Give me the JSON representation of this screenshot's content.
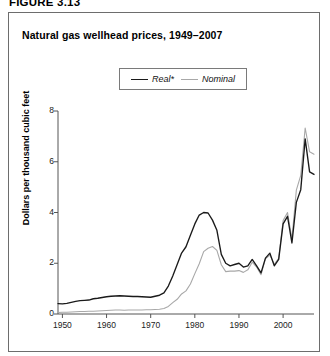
{
  "figure": {
    "label": "FIGURE 3.13",
    "title": "Natural gas wellhead prices, 1949–2007",
    "footnote": "*In chained (2000) dollars, calculated by using gross domestic product implicit"
  },
  "legend": {
    "items": [
      {
        "label": "Real*",
        "color": "#1a1a1a",
        "style": "thick"
      },
      {
        "label": "Nominal",
        "color": "#a8a8a8",
        "style": "thin"
      }
    ]
  },
  "axes": {
    "y_label": "Dollars per thousand cubic feet",
    "y_ticks": [
      "0",
      "2",
      "4",
      "6",
      "8"
    ],
    "x_ticks": [
      "1950",
      "1960",
      "1970",
      "1980",
      "1990",
      "2000"
    ]
  },
  "chart_data": {
    "type": "line",
    "title": "Natural gas wellhead prices, 1949–2007",
    "xlabel": "",
    "ylabel": "Dollars per thousand cubic feet",
    "xlim": [
      1949,
      2007
    ],
    "ylim": [
      0,
      8
    ],
    "yticks": [
      0,
      2,
      4,
      6,
      8
    ],
    "xticks": [
      1950,
      1960,
      1970,
      1980,
      1990,
      2000
    ],
    "grid": false,
    "legend_position": "top-center",
    "annotations": [
      "*In chained (2000) dollars, calculated by using gross domestic product implicit"
    ],
    "x": [
      1949,
      1950,
      1951,
      1952,
      1953,
      1954,
      1955,
      1956,
      1957,
      1958,
      1959,
      1960,
      1961,
      1962,
      1963,
      1964,
      1965,
      1966,
      1967,
      1968,
      1969,
      1970,
      1971,
      1972,
      1973,
      1974,
      1975,
      1976,
      1977,
      1978,
      1979,
      1980,
      1981,
      1982,
      1983,
      1984,
      1985,
      1986,
      1987,
      1988,
      1989,
      1990,
      1991,
      1992,
      1993,
      1994,
      1995,
      1996,
      1997,
      1998,
      1999,
      2000,
      2001,
      2002,
      2003,
      2004,
      2005,
      2006,
      2007
    ],
    "series": [
      {
        "name": "Real*",
        "color": "#1a1a1a",
        "values": [
          0.41,
          0.4,
          0.42,
          0.46,
          0.5,
          0.53,
          0.54,
          0.55,
          0.6,
          0.62,
          0.65,
          0.68,
          0.7,
          0.71,
          0.72,
          0.71,
          0.7,
          0.69,
          0.69,
          0.68,
          0.67,
          0.66,
          0.7,
          0.74,
          0.83,
          1.1,
          1.5,
          1.95,
          2.4,
          2.65,
          3.1,
          3.55,
          3.9,
          4.0,
          3.98,
          3.7,
          3.3,
          2.35,
          2.0,
          1.9,
          1.95,
          2.0,
          1.85,
          1.9,
          2.15,
          1.9,
          1.62,
          2.2,
          2.4,
          1.9,
          2.15,
          3.55,
          3.85,
          2.8,
          4.4,
          4.9,
          6.9,
          5.6,
          5.5
        ]
      },
      {
        "name": "Nominal",
        "color": "#a8a8a8",
        "values": [
          0.06,
          0.07,
          0.07,
          0.08,
          0.09,
          0.1,
          0.1,
          0.11,
          0.11,
          0.12,
          0.13,
          0.14,
          0.15,
          0.16,
          0.16,
          0.15,
          0.16,
          0.16,
          0.16,
          0.16,
          0.17,
          0.17,
          0.18,
          0.19,
          0.22,
          0.3,
          0.45,
          0.58,
          0.79,
          0.91,
          1.18,
          1.59,
          1.98,
          2.46,
          2.59,
          2.66,
          2.51,
          1.94,
          1.67,
          1.69,
          1.69,
          1.71,
          1.64,
          1.74,
          2.04,
          1.85,
          1.55,
          2.17,
          2.32,
          1.96,
          2.19,
          3.68,
          4.0,
          2.95,
          4.88,
          5.46,
          7.33,
          6.39,
          6.3
        ]
      }
    ]
  }
}
